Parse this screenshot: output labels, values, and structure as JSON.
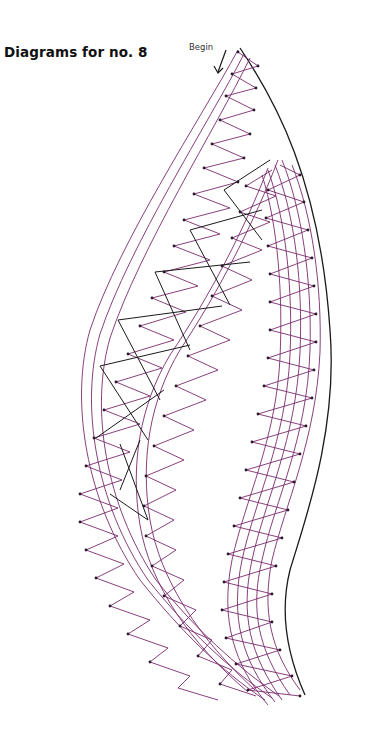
{
  "title": "Diagrams for no. 8",
  "annotation": {
    "label": "Begin",
    "icon": "arrow-down-left-icon"
  },
  "colors": {
    "thread": "#7a2a6e",
    "outline": "#1a1a1a",
    "pinhole": "#2a1a2a",
    "background": "#ffffff"
  },
  "diagram": {
    "type": "bobbin-lace-pricking",
    "parts": [
      {
        "name": "left-leaf-braid",
        "description": "curved leaf shape with two cloth-stitch braids and crossing ground lines"
      },
      {
        "name": "right-tape-band",
        "description": "long S-curved tape with zig-zag pinholes along outer edge"
      }
    ]
  }
}
